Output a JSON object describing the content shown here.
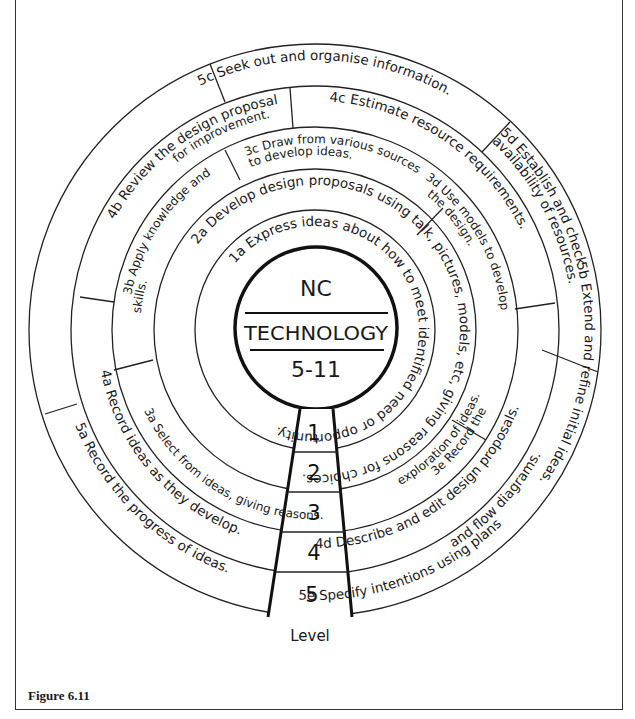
{
  "center": {
    "line1": "NC",
    "line2": "TECHNOLOGY",
    "line3": "5-11"
  },
  "levels": {
    "label": "Level",
    "numbers": [
      "1",
      "2",
      "3",
      "4",
      "5"
    ]
  },
  "rings": {
    "level1": {
      "1a": "1a Express ideas about how to meet identified need or opportunity."
    },
    "level2": {
      "2a": "2a Develop design proposals using talk, pictures, models, etc, giving reasons for choices."
    },
    "level3": {
      "3a": "3a Select from ideas, giving reasons.",
      "3b_line1": "3b Apply knowledge and",
      "3b_line2": "skills.",
      "3c_line1": "3c Draw from various sources",
      "3c_line2": "to develop ideas.",
      "3d_line1": "3d Use models to develop",
      "3d_line2": "the design.",
      "3e_line1": "3e Record the",
      "3e_line2": "exploration of ideas."
    },
    "level4": {
      "4a": "4a Record ideas as they develop.",
      "4b_line1": "4b Review the design proposal",
      "4b_line2": "for improvement.",
      "4c": "4c Estimate resource requirements.",
      "4d": "4d Describe and edit design proposals."
    },
    "level5": {
      "5a": "5a Record the progress of ideas.",
      "5b": "5b Extend and refine initial ideas.",
      "5c": "5c Seek out and organise information.",
      "5d_line1": "5d Establish and check",
      "5d_line2": "availability of resources.",
      "5e_line1": "5e Specify intentions using plans",
      "5e_line2": "and flow diagrams."
    }
  },
  "caption": "Figure 6.11"
}
